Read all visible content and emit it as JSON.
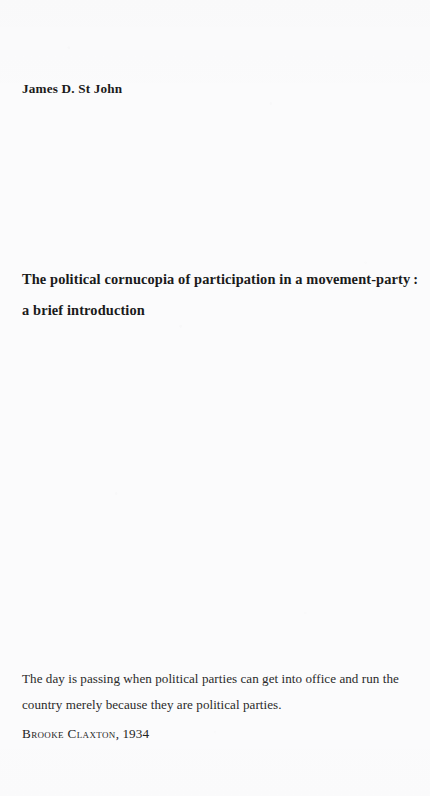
{
  "page": {
    "background_color": "#fbfbfc",
    "text_color": "#1a1a1a"
  },
  "author": {
    "name": "James D. St John"
  },
  "title": {
    "line1": "The political cornucopia of participation in a movement-party :",
    "line2": "a brief introduction",
    "full": "The political cornucopia of participation in a movement-party : a brief introduction"
  },
  "epigraph": {
    "quote_line1": "The day is passing when political parties can get into office and run the",
    "quote_line2": "country merely because they are political parties.",
    "quote_full": "The day is passing when political parties can get into office and run the country merely because they are political parties.",
    "attribution_name": "Brooke Claxton",
    "attribution_separator": ", ",
    "attribution_year": "1934"
  }
}
